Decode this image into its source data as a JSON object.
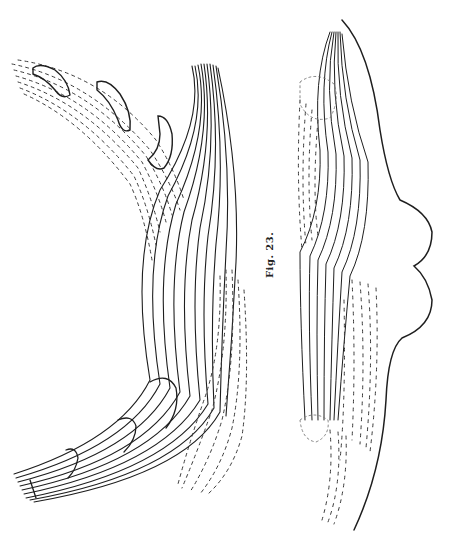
{
  "figure": {
    "caption": "Fig. 23.",
    "header_fragment": "",
    "ink_color": "#1e1e1e",
    "dash_color": "#3a3a3a",
    "background": "#ffffff"
  },
  "panels": [
    {
      "name": "left-drawing",
      "description": "curved fibre bundle with dashed stippled band and outlined lobes"
    },
    {
      "name": "right-drawing",
      "description": "S-curved fibre bundle with dashed fields and undulating outer contour"
    }
  ]
}
